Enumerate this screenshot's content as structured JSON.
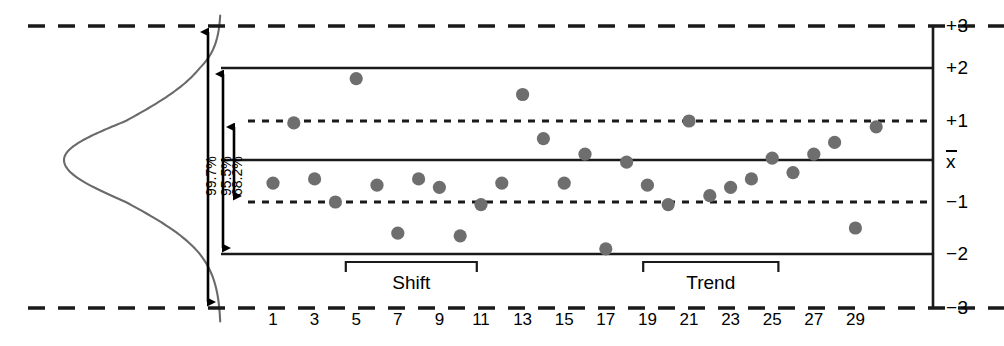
{
  "chart_data": {
    "type": "scatter",
    "title": "",
    "xlabel": "",
    "ylabel": "",
    "x": [
      1,
      2,
      3,
      4,
      5,
      6,
      7,
      8,
      9,
      10,
      11,
      12,
      13,
      14,
      15,
      16,
      17,
      18,
      19,
      20,
      21,
      22,
      23,
      24,
      25,
      26,
      27,
      28,
      29,
      30
    ],
    "values": [
      -0.55,
      0.95,
      -0.45,
      -1.0,
      1.8,
      -0.6,
      -1.6,
      -0.45,
      -0.65,
      -1.65,
      -1.05,
      -0.55,
      1.5,
      0.55,
      -0.55,
      0.15,
      -1.9,
      -0.05,
      -0.6,
      -1.05,
      1.0,
      -0.85,
      -0.65,
      -0.45,
      0.05,
      -0.3,
      0.15,
      0.45,
      -1.5,
      0.85
    ],
    "ylim": [
      -3,
      3
    ],
    "xlim": [
      0.2,
      30.8
    ],
    "grid": false,
    "legend": null,
    "point_color": "#6e6e6e",
    "x_tick_labels": [
      "1",
      "3",
      "5",
      "7",
      "9",
      "11",
      "13",
      "15",
      "17",
      "19",
      "21",
      "23",
      "25",
      "27",
      "29"
    ],
    "x_tick_values": [
      1,
      3,
      5,
      7,
      9,
      11,
      13,
      15,
      17,
      19,
      21,
      23,
      25,
      27,
      29
    ],
    "y_tick_labels": [
      "+3",
      "+2",
      "+1",
      "x̄",
      "−1",
      "−2",
      "−3"
    ],
    "y_tick_values": [
      3,
      2,
      1,
      0,
      -1,
      -2,
      -3
    ],
    "reference_lines": [
      {
        "value": 3,
        "label": "+3",
        "style": "dashed"
      },
      {
        "value": 2,
        "label": "+2",
        "style": "solid"
      },
      {
        "value": 1,
        "label": "+1",
        "style": "dotted"
      },
      {
        "value": 0,
        "label": "x̄",
        "style": "solid"
      },
      {
        "value": -1,
        "label": "−1",
        "style": "dotted"
      },
      {
        "value": -2,
        "label": "−2",
        "style": "solid"
      },
      {
        "value": -3,
        "label": "−3",
        "style": "dashed"
      }
    ],
    "distribution_curve": {
      "name": "normal-distribution-curve",
      "orientation": "vertical",
      "color": "#6a6a6a"
    },
    "sigma_annotations": [
      {
        "label": "99.7%",
        "span": [
          -3,
          3
        ]
      },
      {
        "label": "95.5%",
        "span": [
          -2,
          2
        ]
      },
      {
        "label": "68.2%",
        "span": [
          -1,
          1
        ]
      }
    ],
    "pattern_annotations": [
      {
        "label": "Shift",
        "start_x": 4.5,
        "end_x": 10.8
      },
      {
        "label": "Trend",
        "start_x": 18.8,
        "end_x": 25.3
      }
    ]
  }
}
